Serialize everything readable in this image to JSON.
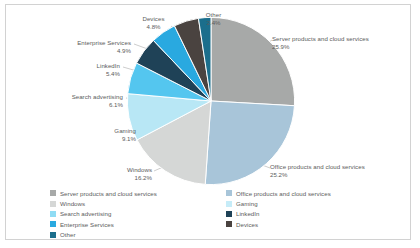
{
  "chart_data": {
    "type": "pie",
    "title": "",
    "categories": [
      "Server products and cloud services",
      "Office products and cloud services",
      "Windows",
      "Gaming",
      "Search advertising",
      "LinkedIn",
      "Enterprise Services",
      "Devices",
      "Other"
    ],
    "values": [
      25.9,
      25.2,
      16.2,
      9.1,
      6.1,
      5.4,
      4.9,
      4.8,
      2.4
    ],
    "unit": "%",
    "colors": [
      "#a7a9a8",
      "#a8c5d9",
      "#d5d7d6",
      "#b8e7f5",
      "#54c6ef",
      "#1f4257",
      "#29a9e0",
      "#4a4340",
      "#1b6e8c"
    ],
    "legend_position": "bottom",
    "grid": false,
    "start_angle_deg": 0,
    "direction": "clockwise"
  },
  "labels": [
    {
      "name": "Server products and cloud services",
      "pct": "25.9%"
    },
    {
      "name": "Office products and cloud services",
      "pct": "25.2%"
    },
    {
      "name": "Windows",
      "pct": "16.2%"
    },
    {
      "name": "Gaming",
      "pct": "9.1%"
    },
    {
      "name": "Search advertising",
      "pct": "6.1%"
    },
    {
      "name": "LinkedIn",
      "pct": "5.4%"
    },
    {
      "name": "Enterprise Services",
      "pct": "4.9%"
    },
    {
      "name": "Devices",
      "pct": "4.8%"
    },
    {
      "name": "Other",
      "pct": "2.4%"
    }
  ],
  "legend": {
    "left": [
      {
        "label": "Server products and cloud services",
        "color": "#a7a9a8"
      },
      {
        "label": "Windows",
        "color": "#d5d7d6"
      },
      {
        "label": "Search advertising",
        "color": "#8fdcf4"
      },
      {
        "label": "Enterprise Services",
        "color": "#29a9e0"
      },
      {
        "label": "Other",
        "color": "#1b6e8c"
      }
    ],
    "right": [
      {
        "label": "Office products and cloud services",
        "color": "#a8c5d9"
      },
      {
        "label": "Gaming",
        "color": "#c6ecf8"
      },
      {
        "label": "LinkedIn",
        "color": "#1f4257"
      },
      {
        "label": "Devices",
        "color": "#4a4340"
      },
      {
        "label": "",
        "color": "#ffffff"
      }
    ]
  }
}
